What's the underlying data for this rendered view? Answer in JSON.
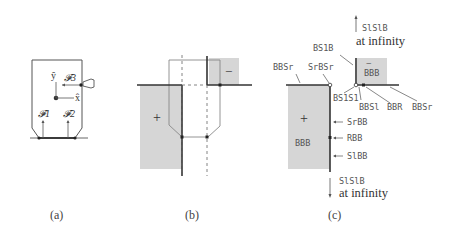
{
  "figure": {
    "panels": [
      {
        "id": "a",
        "caption": "(a)",
        "labels": {
          "y_axis": "ŷ",
          "x_axis": "x̂",
          "force_1": "𝓕1",
          "force_2": "𝓕2",
          "force_3": "𝓕3"
        }
      },
      {
        "id": "b",
        "caption": "(b)",
        "labels": {
          "plus_region": "+",
          "minus_region": "−"
        }
      },
      {
        "id": "c",
        "caption": "(c)",
        "labels": {
          "top_arrow_label": "SlSlB",
          "top_arrow_sub": "at infinity",
          "bottom_arrow_label": "SlSlB",
          "bottom_arrow_sub": "at infinity",
          "bs1b": "BS1B",
          "bbsr_left": "BBSr",
          "srbsr": "SrBSr",
          "bs1s1": "BS1S1",
          "bbs1": "BBSl",
          "bbr": "BBR",
          "bbsr_right": "BBSr",
          "srbb": "SrBB",
          "rbb": "RBB",
          "slbb": "SlBB",
          "plus_region": "+",
          "plus_region_name": "BBB",
          "minus_region": "−",
          "minus_region_name": "BBB"
        }
      }
    ],
    "colors": {
      "region_fill": "#d6d6d6",
      "line": "#333333",
      "thin_line": "#777777"
    }
  }
}
